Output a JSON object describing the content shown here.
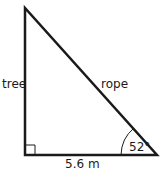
{
  "diagram": {
    "type": "right-triangle",
    "labels": {
      "vertical_side": "tree",
      "hypotenuse": "rope",
      "base": "5.6 m",
      "angle": "52°"
    },
    "colors": {
      "stroke": "#1a1a1a",
      "background": "#ffffff"
    }
  }
}
